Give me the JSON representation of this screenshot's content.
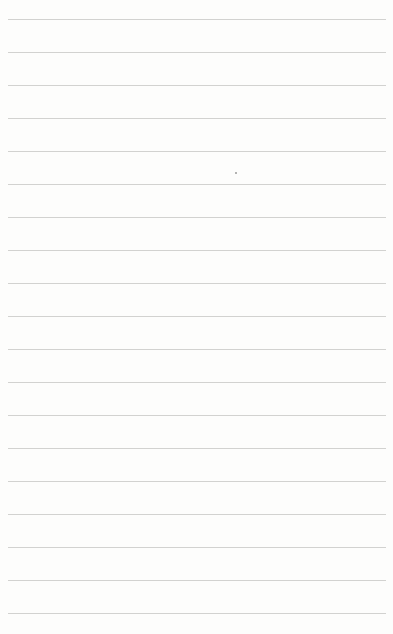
{
  "page": {
    "type": "lined-paper",
    "background_color": "#fdfdfc",
    "rule_color": "#d2d2d0",
    "rule_count": 19
  }
}
